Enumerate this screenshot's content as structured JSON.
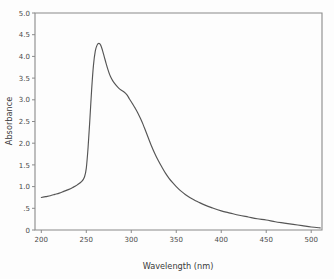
{
  "chart_data": {
    "type": "line",
    "title": "",
    "xlabel": "Wavelength (nm)",
    "ylabel": "Absorbance",
    "xlim": [
      193,
      512
    ],
    "ylim": [
      0,
      5.0
    ],
    "grid": false,
    "legend": null,
    "xticks": [
      200,
      250,
      300,
      350,
      400,
      450,
      500
    ],
    "xtick_labels": [
      "200",
      "250",
      "300",
      "350",
      "400",
      "450",
      "500"
    ],
    "yticks": [
      0,
      0.5,
      1.0,
      1.5,
      2.0,
      2.5,
      3.0,
      3.5,
      4.0,
      4.5,
      5.0
    ],
    "ytick_labels": [
      "0",
      ".5",
      "1.0",
      "1.5",
      "2.0",
      "2.5",
      "3.0",
      "3.5",
      "4.0",
      "4.5",
      "5.0"
    ],
    "series": [
      {
        "name": "absorbance-spectrum",
        "color": "#555555",
        "x": [
          200,
          205,
          210,
          215,
          220,
          225,
          230,
          235,
          240,
          245,
          248,
          250,
          252,
          254,
          256,
          258,
          260,
          262,
          264,
          266,
          268,
          270,
          272,
          274,
          276,
          278,
          280,
          283,
          286,
          289,
          292,
          295,
          298,
          301,
          304,
          307,
          310,
          313,
          316,
          319,
          322,
          326,
          330,
          334,
          338,
          342,
          346,
          350,
          355,
          360,
          365,
          370,
          375,
          380,
          390,
          400,
          410,
          420,
          430,
          440,
          450,
          460,
          470,
          480,
          490,
          500,
          510
        ],
        "y": [
          0.75,
          0.77,
          0.79,
          0.82,
          0.85,
          0.89,
          0.93,
          0.98,
          1.04,
          1.12,
          1.22,
          1.42,
          1.9,
          2.55,
          3.25,
          3.8,
          4.12,
          4.26,
          4.3,
          4.26,
          4.14,
          3.99,
          3.84,
          3.7,
          3.58,
          3.49,
          3.42,
          3.34,
          3.27,
          3.22,
          3.18,
          3.12,
          3.02,
          2.92,
          2.82,
          2.71,
          2.58,
          2.44,
          2.28,
          2.12,
          1.96,
          1.77,
          1.6,
          1.45,
          1.31,
          1.19,
          1.09,
          1.0,
          0.9,
          0.82,
          0.75,
          0.69,
          0.64,
          0.59,
          0.51,
          0.44,
          0.39,
          0.34,
          0.3,
          0.26,
          0.23,
          0.19,
          0.16,
          0.13,
          0.1,
          0.07,
          0.05
        ]
      }
    ],
    "annotations": {
      "peak_wavelength_nm": 264,
      "peak_absorbance": 4.3,
      "start_absorbance": 0.75,
      "shoulder_wavelength_nm": 290,
      "shoulder_absorbance": 3.2
    }
  }
}
